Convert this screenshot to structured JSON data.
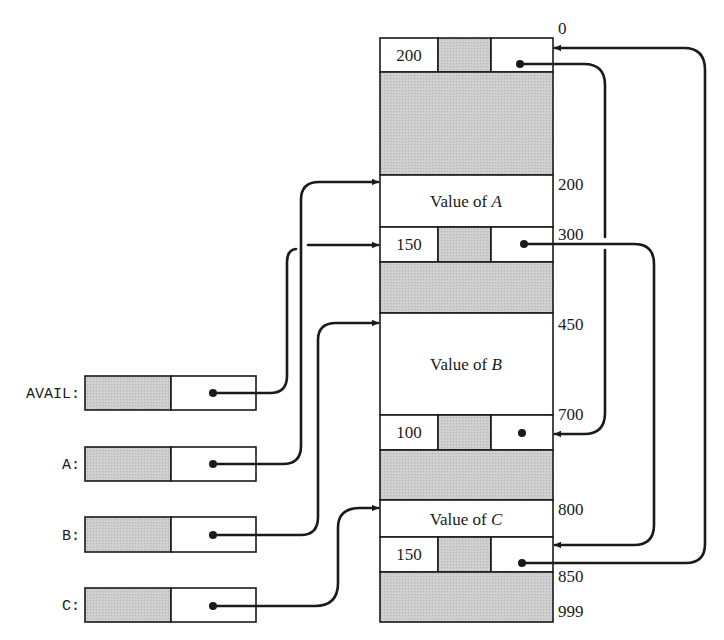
{
  "colors": {
    "ink": "#1a1a1a",
    "shade": "#c9c9c9",
    "background": "#ffffff"
  },
  "memory": {
    "address_labels": [
      "0",
      "200",
      "300",
      "450",
      "700",
      "800",
      "850",
      "999"
    ],
    "blocks": [
      {
        "id": "free-block-0",
        "type": "free-header",
        "address": "0",
        "size_field": "200",
        "link": "700"
      },
      {
        "id": "free-body-0",
        "type": "free-body"
      },
      {
        "id": "value-a",
        "type": "value",
        "address": "200",
        "label_prefix": "Value of ",
        "label_var": "A"
      },
      {
        "id": "free-block-300",
        "type": "free-header",
        "address": "300",
        "size_field": "150",
        "link": "850"
      },
      {
        "id": "free-body-300",
        "type": "free-body"
      },
      {
        "id": "value-b",
        "type": "value",
        "address": "450",
        "label_prefix": "Value of ",
        "label_var": "B"
      },
      {
        "id": "free-block-700",
        "type": "free-header",
        "address": "700",
        "size_field": "100",
        "link": "null"
      },
      {
        "id": "free-body-700",
        "type": "free-body"
      },
      {
        "id": "value-c",
        "type": "value",
        "address": "800",
        "label_prefix": "Value of ",
        "label_var": "C"
      },
      {
        "id": "free-block-850",
        "type": "free-header",
        "address": "850",
        "size_field": "150",
        "link": "0"
      },
      {
        "id": "free-body-850",
        "type": "free-body",
        "end_address": "999"
      }
    ]
  },
  "pointers": [
    {
      "name": "AVAIL",
      "label": "AVAIL:",
      "points_to": "300"
    },
    {
      "name": "A",
      "label": "A:",
      "points_to": "200"
    },
    {
      "name": "B",
      "label": "B:",
      "points_to": "450"
    },
    {
      "name": "C",
      "label": "C:",
      "points_to": "800"
    }
  ],
  "text": {
    "hdr0_size": "200",
    "hdr300_size": "150",
    "hdr700_size": "100",
    "hdr850_size": "150",
    "value_prefix": "Value of ",
    "var_a": "A",
    "var_b": "B",
    "var_c": "C",
    "addr_0": "0",
    "addr_200": "200",
    "addr_300": "300",
    "addr_450": "450",
    "addr_700": "700",
    "addr_800": "800",
    "addr_850": "850",
    "addr_999": "999",
    "ptr_avail": "AVAIL:",
    "ptr_a": "A:",
    "ptr_b": "B:",
    "ptr_c": "C:"
  }
}
